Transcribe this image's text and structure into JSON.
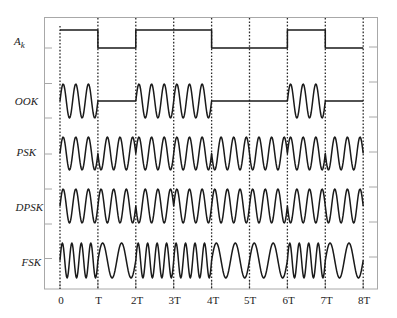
{
  "chart_data": {
    "type": "line",
    "title": "",
    "xlabel": "",
    "ylabel": "",
    "bits": [
      1,
      0,
      1,
      1,
      0,
      0,
      1,
      0
    ],
    "x_tick_labels": [
      "0",
      "T",
      "2T",
      "3T",
      "4T",
      "5T",
      "6T",
      "7T",
      "8T"
    ],
    "xlim": [
      0,
      8
    ],
    "grid": false,
    "legend": null,
    "vertical_dotted_lines_at": [
      0,
      1,
      2,
      3,
      4,
      5,
      6,
      7,
      8
    ],
    "series": [
      {
        "name": "A_k",
        "label_main": "A",
        "label_sub": "k",
        "kind": "levels",
        "values": [
          1,
          0,
          1,
          1,
          0,
          0,
          1,
          0
        ]
      },
      {
        "name": "OOK",
        "kind": "ook",
        "cycles_per_bit": 3,
        "amplitude_per_bit": [
          1,
          0,
          1,
          1,
          0,
          0,
          1,
          0
        ]
      },
      {
        "name": "PSK",
        "kind": "psk",
        "cycles_per_bit": 3,
        "phase_sign_per_bit": [
          1,
          -1,
          1,
          1,
          -1,
          -1,
          1,
          -1
        ]
      },
      {
        "name": "DPSK",
        "kind": "psk",
        "cycles_per_bit": 3,
        "phase_sign_per_bit": [
          1,
          1,
          -1,
          1,
          1,
          1,
          -1,
          -1
        ]
      },
      {
        "name": "FSK",
        "kind": "fsk",
        "cycles_per_bit_each": [
          4,
          2,
          4,
          4,
          2,
          2,
          4,
          2
        ]
      }
    ],
    "colors": {
      "waveform": "#1a1a1a",
      "frame": "#a8a8a8",
      "dotted_lines": "#2a2a2a",
      "background": "#ffffff"
    }
  }
}
